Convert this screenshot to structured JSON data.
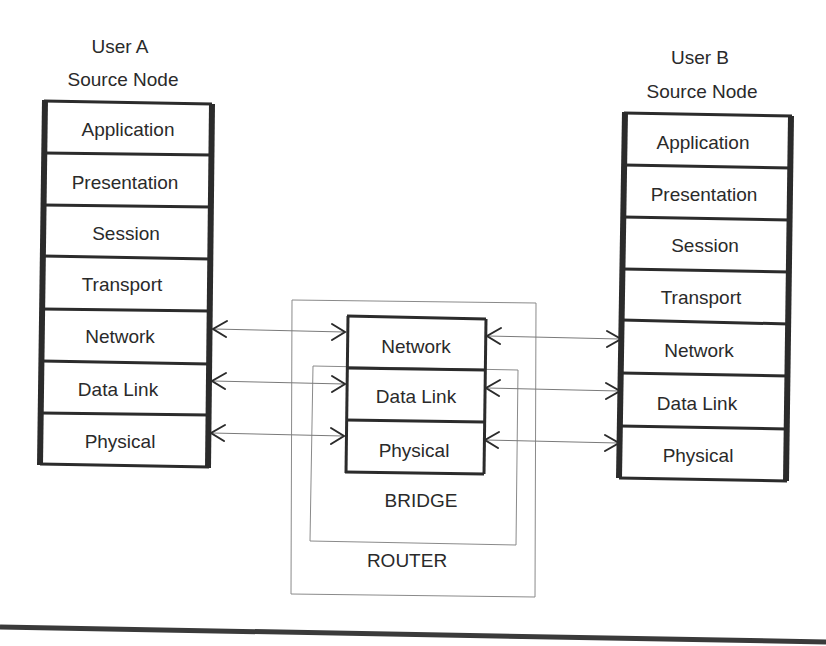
{
  "diagram": {
    "user_a": {
      "title_line1": "User A",
      "title_line2": "Source Node",
      "layers": [
        "Application",
        "Presentation",
        "Session",
        "Transport",
        "Network",
        "Data Link",
        "Physical"
      ]
    },
    "user_b": {
      "title_line1": "User B",
      "title_line2": "Source Node",
      "layers": [
        "Application",
        "Presentation",
        "Session",
        "Transport",
        "Network",
        "Data Link",
        "Physical"
      ]
    },
    "intermediate": {
      "layers": [
        "Network",
        "Data Link",
        "Physical"
      ],
      "bridge_label": "BRIDGE",
      "router_label": "ROUTER"
    },
    "connections": [
      {
        "from": "User A Network",
        "to": "Intermediate Network",
        "type": "bidirectional"
      },
      {
        "from": "User A Data Link",
        "to": "Intermediate Data Link",
        "type": "bidirectional"
      },
      {
        "from": "User A Physical",
        "to": "Intermediate Physical",
        "type": "bidirectional"
      },
      {
        "from": "Intermediate Network",
        "to": "User B Network",
        "type": "bidirectional"
      },
      {
        "from": "Intermediate Data Link",
        "to": "User B Data Link",
        "type": "bidirectional"
      },
      {
        "from": "Intermediate Physical",
        "to": "User B Physical",
        "type": "bidirectional"
      }
    ],
    "colors": {
      "stroke": "#2b2b2b",
      "thin_line": "#8a8a8a",
      "background": "#ffffff"
    }
  }
}
